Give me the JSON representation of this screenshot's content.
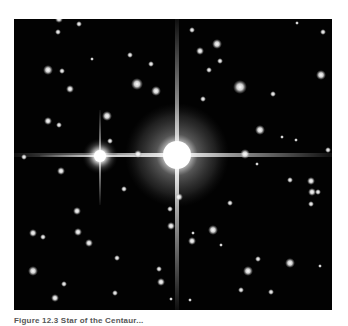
{
  "figure": {
    "type": "astronomical photograph",
    "caption": "Figure 12.3 Star of the Centaur..."
  },
  "colors": {
    "background": "#ffffff",
    "sky": "#020202",
    "star": "#ffffff"
  },
  "stars": {
    "primary": {
      "x": 177,
      "y": 155,
      "halo_radius": 48
    },
    "secondary": {
      "x": 100,
      "y": 156
    }
  }
}
